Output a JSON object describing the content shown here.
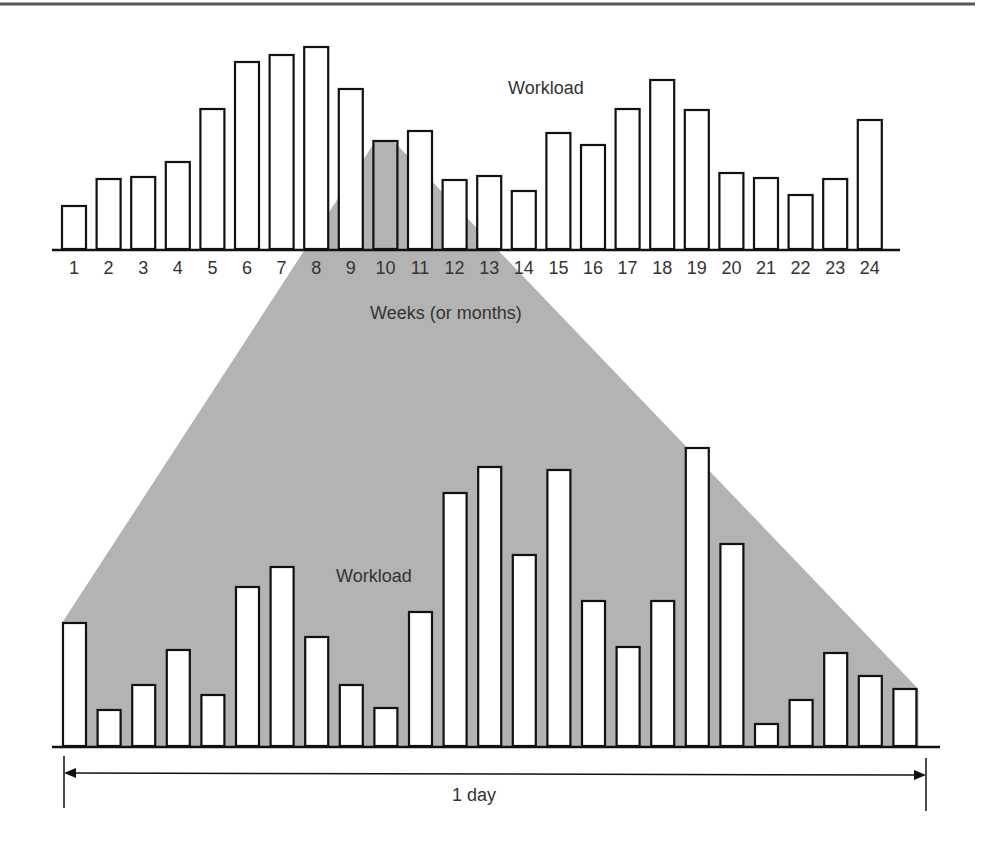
{
  "figure": {
    "top_rule": true,
    "upper_chart": {
      "label": "Workload",
      "xlabel": "Weeks (or months)"
    },
    "lower_chart": {
      "label": "Workload",
      "span_label": "1 day"
    },
    "colors": {
      "shade": "#b3b3b3",
      "bar_fill": "#ffffff",
      "bar_stroke": "#111111",
      "text": "#333333",
      "rule": "#555555"
    }
  },
  "chart_data": [
    {
      "type": "bar",
      "title": "",
      "annotation": "Workload",
      "xlabel": "Weeks (or months)",
      "ylabel": "",
      "categories": [
        "1",
        "2",
        "3",
        "4",
        "5",
        "6",
        "7",
        "8",
        "9",
        "10",
        "11",
        "12",
        "13",
        "14",
        "15",
        "16",
        "17",
        "18",
        "19",
        "20",
        "21",
        "22",
        "23",
        "24"
      ],
      "values": [
        43,
        70,
        72,
        87,
        140,
        187,
        194,
        202,
        160,
        108,
        118,
        69,
        73,
        58,
        116,
        104,
        140,
        169,
        139,
        76,
        71,
        54,
        70,
        129
      ],
      "value_units": "relative (px height, no y-axis shown)",
      "highlighted_category": "10",
      "grid": false,
      "legend": "none"
    },
    {
      "type": "bar",
      "title": "",
      "annotation": "Workload",
      "xlabel": "1 day",
      "ylabel": "",
      "categories": [
        "1",
        "2",
        "3",
        "4",
        "5",
        "6",
        "7",
        "8",
        "9",
        "10",
        "11",
        "12",
        "13",
        "14",
        "15",
        "16",
        "17",
        "18",
        "19",
        "20",
        "21",
        "22",
        "23",
        "24",
        "25"
      ],
      "category_labels_visible": false,
      "values": [
        123,
        36,
        61,
        96,
        51,
        159,
        179,
        109,
        61,
        38,
        134,
        253,
        279,
        191,
        276,
        145,
        99,
        145,
        298,
        202,
        22,
        46,
        93,
        70,
        57
      ],
      "value_units": "relative (px height, no y-axis shown)",
      "note": "Expanded view of the workload within one period (bar 10 of upper chart), shown via gray zoom triangle",
      "grid": false,
      "legend": "none"
    }
  ]
}
